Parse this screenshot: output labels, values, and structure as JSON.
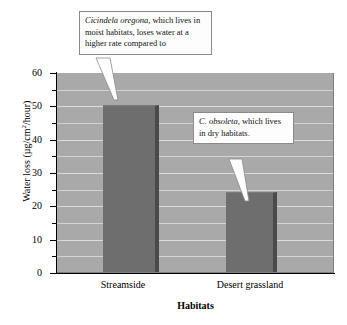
{
  "chart_data": {
    "type": "bar",
    "title": "",
    "categories": [
      "Streamside",
      "Desert grassland"
    ],
    "values": [
      50.5,
      24
    ],
    "xlabel": "Habitats",
    "ylabel": "Water loss (µg/cm2/hour)",
    "ylabel_parts": {
      "prefix": "Water loss (µg/cm",
      "superscript": "2",
      "suffix": "/hour)"
    },
    "ylim": [
      0,
      60
    ],
    "ytick_major": [
      0,
      10,
      20,
      30,
      40,
      50,
      60
    ],
    "ytick_minor": [
      5,
      15,
      25,
      35,
      45,
      55
    ],
    "ytick_labels": [
      "0",
      "10",
      "20",
      "30",
      "40",
      "50",
      "60"
    ],
    "grid": true,
    "gridline_interval": 5,
    "legend": "none",
    "bar_color": "#6e6e6e",
    "bar_edge_color": "#4a4a4a",
    "plot_background": "#a9a9a9",
    "gridline_color": "#dcdcdc",
    "page_background": "#ffffff",
    "annotations": [
      {
        "id": "callout-1",
        "species_italic": "Cicindela oregona",
        "text_rest": ", which lives in moist habitats, loses water at a higher rate compared to",
        "full_text": "Cicindela oregona, which lives in moist habitats, loses water at a higher rate compared to",
        "points_to_category": "Streamside"
      },
      {
        "id": "callout-2",
        "species_italic": "C. obsoleta",
        "text_rest": ", which lives in dry habitats.",
        "full_text": "C. obsoleta, which lives in dry habitats.",
        "points_to_category": "Desert grassland"
      }
    ]
  }
}
